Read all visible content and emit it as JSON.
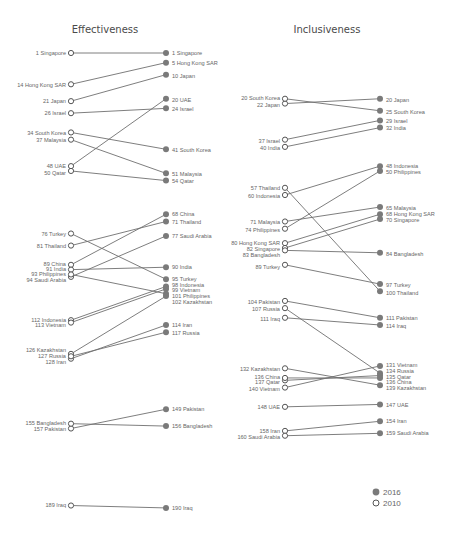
{
  "chart_data": [
    {
      "type": "slope",
      "title": "Effectiveness",
      "xlabel": "",
      "ylabel": "Rank",
      "x": [
        "2010",
        "2016"
      ],
      "series": [
        {
          "name": "Singapore",
          "values": [
            1,
            1
          ]
        },
        {
          "name": "Hong Kong SAR",
          "values": [
            14,
            5
          ]
        },
        {
          "name": "Japan",
          "values": [
            21,
            10
          ]
        },
        {
          "name": "Israel",
          "values": [
            26,
            24
          ]
        },
        {
          "name": "UAE",
          "values": [
            48,
            20
          ]
        },
        {
          "name": "South Korea",
          "values": [
            34,
            41
          ]
        },
        {
          "name": "Malaysia",
          "values": [
            37,
            51
          ]
        },
        {
          "name": "Qatar",
          "values": [
            50,
            54
          ]
        },
        {
          "name": "China",
          "values": [
            89,
            68
          ]
        },
        {
          "name": "Thailand",
          "values": [
            81,
            71
          ]
        },
        {
          "name": "Saudi Arabia",
          "values": [
            94,
            77
          ]
        },
        {
          "name": "India",
          "values": [
            91,
            90
          ]
        },
        {
          "name": "Turkey",
          "values": [
            76,
            95
          ]
        },
        {
          "name": "Indonesia",
          "values": [
            112,
            98
          ]
        },
        {
          "name": "Vietnam",
          "values": [
            113,
            99
          ]
        },
        {
          "name": "Philippines",
          "values": [
            93,
            101
          ]
        },
        {
          "name": "Kazakhstan",
          "values": [
            126,
            102
          ]
        },
        {
          "name": "Iran",
          "values": [
            128,
            114
          ]
        },
        {
          "name": "Russia",
          "values": [
            127,
            117
          ]
        },
        {
          "name": "Pakistan",
          "values": [
            157,
            149
          ]
        },
        {
          "name": "Bangladesh",
          "values": [
            155,
            156
          ]
        },
        {
          "name": "Iraq",
          "values": [
            189,
            190
          ]
        }
      ]
    },
    {
      "type": "slope",
      "title": "Inclusiveness",
      "xlabel": "",
      "ylabel": "Rank",
      "x": [
        "2010",
        "2016"
      ],
      "series": [
        {
          "name": "Japan",
          "values": [
            22,
            20
          ]
        },
        {
          "name": "South Korea",
          "values": [
            20,
            25
          ]
        },
        {
          "name": "Israel",
          "values": [
            37,
            29
          ]
        },
        {
          "name": "India",
          "values": [
            40,
            32
          ]
        },
        {
          "name": "Indonesia",
          "values": [
            60,
            48
          ]
        },
        {
          "name": "Philippines",
          "values": [
            74,
            50
          ]
        },
        {
          "name": "Malaysia",
          "values": [
            71,
            65
          ]
        },
        {
          "name": "Hong Kong SAR",
          "values": [
            80,
            68
          ]
        },
        {
          "name": "Singapore",
          "values": [
            82,
            70
          ]
        },
        {
          "name": "Bangladesh",
          "values": [
            83,
            84
          ]
        },
        {
          "name": "Turkey",
          "values": [
            89,
            97
          ]
        },
        {
          "name": "Thailand",
          "values": [
            57,
            100
          ]
        },
        {
          "name": "Pakistan",
          "values": [
            104,
            111
          ]
        },
        {
          "name": "Iraq",
          "values": [
            111,
            114
          ]
        },
        {
          "name": "Vietnam",
          "values": [
            140,
            131
          ]
        },
        {
          "name": "Russia",
          "values": [
            107,
            134
          ]
        },
        {
          "name": "Qatar",
          "values": [
            137,
            135
          ]
        },
        {
          "name": "China",
          "values": [
            136,
            136
          ]
        },
        {
          "name": "Kazakhstan",
          "values": [
            132,
            139
          ]
        },
        {
          "name": "UAE",
          "values": [
            148,
            147
          ]
        },
        {
          "name": "Iran",
          "values": [
            158,
            154
          ]
        },
        {
          "name": "Saudi Arabia",
          "values": [
            160,
            159
          ]
        }
      ]
    }
  ],
  "legend": [
    {
      "label": "2016",
      "marker": "filled-circle"
    },
    {
      "label": "2010",
      "marker": "open-circle"
    }
  ],
  "colors": {
    "line": "#6f6f6f",
    "dot_2016": "#7a7a7a",
    "text": "#666666"
  },
  "left_labels": {
    "p0": [
      {
        "text": "1 Singapore",
        "y": 53
      },
      {
        "text": "14 Hong Kong SAR",
        "y": 85
      },
      {
        "text": "21 Japan",
        "y": 101
      },
      {
        "text": "26 Israel",
        "y": 113
      },
      {
        "text": "34 South Korea",
        "y": 133
      },
      {
        "text": "37 Malaysia",
        "y": 140
      },
      {
        "text": "48 UAE",
        "y": 166
      },
      {
        "text": "50 Qatar",
        "y": 173
      },
      {
        "text": "76 Turkey",
        "y": 234
      },
      {
        "text": "81 Thailand",
        "y": 246
      },
      {
        "text": "89 China",
        "y": 264
      },
      {
        "text": "91 India",
        "y": 269
      },
      {
        "text": "93 Philippines",
        "y": 274
      },
      {
        "text": "94 Saudi Arabia",
        "y": 280
      },
      {
        "text": "112 Indonesia",
        "y": 320
      },
      {
        "text": "113 Vietnam",
        "y": 325
      },
      {
        "text": "126 Kazakhstan",
        "y": 350
      },
      {
        "text": "127 Russia",
        "y": 356
      },
      {
        "text": "128 Iran",
        "y": 362
      },
      {
        "text": "155 Bangladesh",
        "y": 423
      },
      {
        "text": "157 Pakistan",
        "y": 429
      },
      {
        "text": "189 Iraq",
        "y": 505
      }
    ],
    "p1": [
      {
        "text": "20 South Korea",
        "y": 98
      },
      {
        "text": "22 Japan",
        "y": 105
      },
      {
        "text": "37 Israel",
        "y": 141
      },
      {
        "text": "40 India",
        "y": 148
      },
      {
        "text": "57 Thailand",
        "y": 188
      },
      {
        "text": "60 Indonesia",
        "y": 196
      },
      {
        "text": "71 Malaysia",
        "y": 222
      },
      {
        "text": "74 Philippines",
        "y": 230
      },
      {
        "text": "80 Hong Kong SAR",
        "y": 243
      },
      {
        "text": "82 Singapore",
        "y": 249
      },
      {
        "text": "83 Bangladesh",
        "y": 255
      },
      {
        "text": "89 Turkey",
        "y": 267
      },
      {
        "text": "104 Pakistan",
        "y": 302
      },
      {
        "text": "107 Russia",
        "y": 309
      },
      {
        "text": "111 Iraq",
        "y": 319
      },
      {
        "text": "132 Kazakhstan",
        "y": 369
      },
      {
        "text": "136 China",
        "y": 377
      },
      {
        "text": "137 Qatar",
        "y": 382
      },
      {
        "text": "140 Viet­nam",
        "y": 389
      },
      {
        "text": "148 UAE",
        "y": 407
      },
      {
        "text": "158 Iran",
        "y": 431
      },
      {
        "text": "160 Saudi Arabia",
        "y": 437
      }
    ]
  },
  "right_labels": {
    "p0": [
      {
        "text": "1 Singapore",
        "y": 53
      },
      {
        "text": "5 Hong Kong SAR",
        "y": 63
      },
      {
        "text": "10 Japan",
        "y": 76
      },
      {
        "text": "20 UAE",
        "y": 100
      },
      {
        "text": "24 Israel",
        "y": 109
      },
      {
        "text": "41 South Korea",
        "y": 150
      },
      {
        "text": "51 Malaysia",
        "y": 174
      },
      {
        "text": "54 Qatar",
        "y": 181
      },
      {
        "text": "68 China",
        "y": 214
      },
      {
        "text": "71 Thailand",
        "y": 222
      },
      {
        "text": "77 Saudi Arabia",
        "y": 236
      },
      {
        "text": "90 India",
        "y": 267
      },
      {
        "text": "95 Turkey",
        "y": 279
      },
      {
        "text": "98 Indonesia",
        "y": 285
      },
      {
        "text": "99 Vietnam",
        "y": 290
      },
      {
        "text": "101 Philippines",
        "y": 296
      },
      {
        "text": "102 Kazakhstan",
        "y": 302
      },
      {
        "text": "114 Iran",
        "y": 325
      },
      {
        "text": "117 Russia",
        "y": 333
      },
      {
        "text": "149 Pakistan",
        "y": 409
      },
      {
        "text": "156 Bangladesh",
        "y": 426
      },
      {
        "text": "190 Iraq",
        "y": 508
      }
    ],
    "p1": [
      {
        "text": "20 Japan",
        "y": 100
      },
      {
        "text": "25 South Korea",
        "y": 112
      },
      {
        "text": "29 Israel",
        "y": 121
      },
      {
        "text": "32 India",
        "y": 128
      },
      {
        "text": "48 Indonesia",
        "y": 166
      },
      {
        "text": "50 Philippines",
        "y": 172
      },
      {
        "text": "65 Malaysia",
        "y": 208
      },
      {
        "text": "68 Hong Kong SAR",
        "y": 214
      },
      {
        "text": "70 Singapore",
        "y": 220
      },
      {
        "text": "84 Bangladesh",
        "y": 254
      },
      {
        "text": "97 Turkey",
        "y": 285
      },
      {
        "text": "100 Thailand",
        "y": 293
      },
      {
        "text": "111 Pakistan",
        "y": 318
      },
      {
        "text": "114 Iraq",
        "y": 326
      },
      {
        "text": "131 Vietnam",
        "y": 365
      },
      {
        "text": "134 Russia",
        "y": 371
      },
      {
        "text": "135 Qatar",
        "y": 377
      },
      {
        "text": "136 China",
        "y": 382
      },
      {
        "text": "139 Kazakhstan",
        "y": 388
      },
      {
        "text": "147 UAE",
        "y": 405
      },
      {
        "text": "154 Iran",
        "y": 421
      },
      {
        "text": "159 Saudi Arabia",
        "y": 433
      }
    ]
  }
}
